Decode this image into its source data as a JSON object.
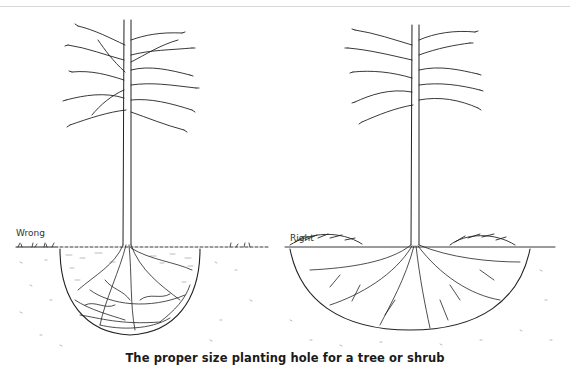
{
  "figure": {
    "caption": "The proper size planting hole for a tree or shrub",
    "panels": [
      {
        "id": "wrong",
        "label": "Wrong",
        "description": "Tree planted in a small, deep hole; roots circle and crowd at bottom"
      },
      {
        "id": "right",
        "label": "Right",
        "description": "Tree planted in a wide, shallow hole; roots spread outward"
      }
    ]
  }
}
